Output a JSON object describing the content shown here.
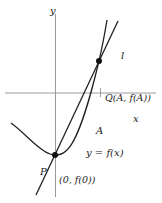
{
  "diagram": {
    "type": "function-graph-with-secant",
    "colors": {
      "axis": "#9a9a9a",
      "curve": "#222222",
      "line": "#222222",
      "point": "#111111",
      "text": "#222222"
    },
    "labels": {
      "y_axis": "y",
      "x_axis": "x",
      "line": "l",
      "point_Q": "Q(A, f(A))",
      "point_P": "P",
      "point_P_coords": "(0, f(0))",
      "A": "A",
      "curve": "y = f(x)"
    },
    "points": [
      {
        "name": "P",
        "coords": "(0, f(0))"
      },
      {
        "name": "Q",
        "coords": "(A, f(A))"
      }
    ]
  }
}
